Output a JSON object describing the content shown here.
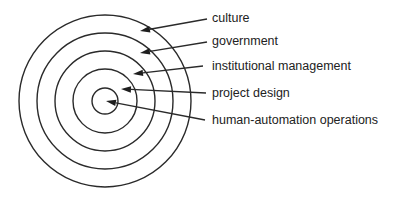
{
  "diagram": {
    "type": "concentric-layers",
    "center": [
      105,
      101
    ],
    "rings": [
      {
        "id": "culture",
        "radius": 86
      },
      {
        "id": "government",
        "radius": 68
      },
      {
        "id": "institutional-management",
        "radius": 50
      },
      {
        "id": "project-design",
        "radius": 32
      },
      {
        "id": "human-automation-operations",
        "radius": 13
      }
    ],
    "labels": [
      {
        "text": "culture",
        "y": 11,
        "arrow_from": [
          207,
          19
        ],
        "arrow_to": [
          140,
          31
        ]
      },
      {
        "text": "government",
        "y": 34,
        "arrow_from": [
          207,
          42
        ],
        "arrow_to": [
          140,
          53
        ]
      },
      {
        "text": "institutional management",
        "y": 59,
        "arrow_from": [
          203,
          66
        ],
        "arrow_to": [
          133,
          74
        ]
      },
      {
        "text": "project design",
        "y": 86,
        "arrow_from": [
          206,
          93
        ],
        "arrow_to": [
          121,
          89
        ]
      },
      {
        "text": "human-automation operations",
        "y": 113,
        "arrow_from": [
          205,
          120
        ],
        "arrow_to": [
          106,
          101
        ]
      }
    ],
    "stroke_color": "#2a2a2a",
    "text_color": "#222222",
    "background": "#ffffff"
  }
}
